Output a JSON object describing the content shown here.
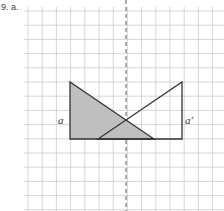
{
  "problem": {
    "number": "9. a."
  },
  "diagram": {
    "grid": {
      "x0": 28,
      "y0": 11,
      "step": 14.2,
      "cols": 14,
      "rows": 14,
      "color": "#cccccc"
    },
    "axis": {
      "x": 126,
      "style": "dashed",
      "color": "#777777"
    },
    "shaded_triangle": {
      "points": "70,82 70,139 154,139",
      "fill": "#bfbfbf",
      "stroke": "#333333",
      "label": "a"
    },
    "reflected_triangle": {
      "points": "182,82 182,139 98,139",
      "fill": "none",
      "stroke": "#333333",
      "label": "a′"
    }
  }
}
